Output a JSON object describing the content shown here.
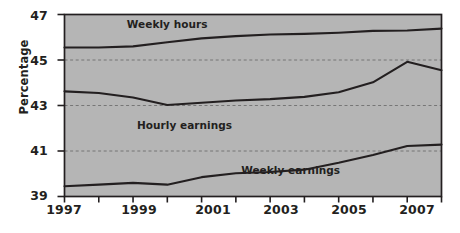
{
  "chart_data": {
    "type": "line",
    "title": "",
    "xlabel": "",
    "ylabel": "Percentage",
    "xlim": [
      1997,
      2008
    ],
    "ylim": [
      39,
      47
    ],
    "grid": true,
    "grid_values": [
      45,
      43,
      41
    ],
    "legend_position": "inline-annotations",
    "plot_background": "#b5b5b5",
    "line_color": "#231f20",
    "x": [
      1997,
      1998,
      1999,
      2000,
      2001,
      2002,
      2003,
      2004,
      2005,
      2006,
      2007,
      2008
    ],
    "y_ticks": [
      39,
      41,
      43,
      45,
      47
    ],
    "y_tick_labels": [
      "39",
      "41",
      "43",
      "45",
      "47"
    ],
    "x_ticks": [
      1997,
      1998,
      1999,
      2000,
      2001,
      2002,
      2003,
      2004,
      2005,
      2006,
      2007,
      2008
    ],
    "x_tick_labels": [
      "1997",
      "",
      "1999",
      "",
      "2001",
      "",
      "2003",
      "",
      "2005",
      "",
      "2007",
      ""
    ],
    "series": [
      {
        "name": "Weekly hours",
        "label_x": 2000.0,
        "label_y": 46.55,
        "values": [
          45.55,
          45.55,
          45.6,
          45.75,
          45.9,
          46.0,
          46.1,
          46.15,
          46.2,
          46.25,
          46.3,
          46.35
        ]
      },
      {
        "name": "Hourly earnings",
        "label_x": 2000.5,
        "label_y": 42.1,
        "values": [
          43.6,
          43.55,
          43.4,
          43.0,
          43.1,
          43.2,
          43.3,
          43.35,
          43.5,
          43.9,
          44.3,
          44.5
        ]
      },
      {
        "name": "Weekly earnings",
        "label_x": 2003.6,
        "label_y": 40.1,
        "values": [
          39.45,
          39.5,
          39.6,
          39.5,
          39.85,
          40.0,
          40.05,
          40.15,
          40.5,
          40.85,
          41.2,
          41.25
        ]
      }
    ],
    "series_detail": [
      {
        "name": "Weekly hours",
        "points": [
          {
            "x": 1997,
            "y": 45.55
          },
          {
            "x": 1998,
            "y": 45.55
          },
          {
            "x": 1999,
            "y": 45.6
          },
          {
            "x": 2000,
            "y": 45.78
          },
          {
            "x": 2001,
            "y": 45.95
          },
          {
            "x": 2002,
            "y": 46.05
          },
          {
            "x": 2003,
            "y": 46.12
          },
          {
            "x": 2004,
            "y": 46.15
          },
          {
            "x": 2005,
            "y": 46.2
          },
          {
            "x": 2006,
            "y": 46.28
          },
          {
            "x": 2007,
            "y": 46.3
          },
          {
            "x": 2008,
            "y": 46.38
          }
        ]
      },
      {
        "name": "Hourly earnings",
        "points": [
          {
            "x": 1997,
            "y": 43.62
          },
          {
            "x": 1998,
            "y": 43.55
          },
          {
            "x": 1999,
            "y": 43.35
          },
          {
            "x": 2000,
            "y": 43.02
          },
          {
            "x": 2001,
            "y": 43.12
          },
          {
            "x": 2002,
            "y": 43.22
          },
          {
            "x": 2003,
            "y": 43.28
          },
          {
            "x": 2004,
            "y": 43.38
          },
          {
            "x": 2005,
            "y": 43.58
          },
          {
            "x": 2006,
            "y": 44.02
          },
          {
            "x": 2007,
            "y": 44.92
          },
          {
            "x": 2008,
            "y": 44.55
          }
        ]
      },
      {
        "name": "Weekly earnings",
        "points": [
          {
            "x": 1997,
            "y": 39.45
          },
          {
            "x": 1998,
            "y": 39.52
          },
          {
            "x": 1999,
            "y": 39.6
          },
          {
            "x": 2000,
            "y": 39.52
          },
          {
            "x": 2001,
            "y": 39.85
          },
          {
            "x": 2002,
            "y": 40.02
          },
          {
            "x": 2003,
            "y": 40.08
          },
          {
            "x": 2004,
            "y": 40.18
          },
          {
            "x": 2005,
            "y": 40.48
          },
          {
            "x": 2006,
            "y": 40.82
          },
          {
            "x": 2007,
            "y": 41.22
          },
          {
            "x": 2008,
            "y": 41.28
          }
        ]
      }
    ]
  }
}
